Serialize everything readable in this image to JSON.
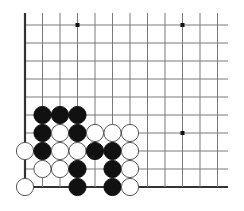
{
  "diagram": {
    "type": "go-board-corner",
    "corner": "bottom-left",
    "colors": {
      "line": "#7a7a7a",
      "edge": "#333333",
      "black": "#111111",
      "white": "#ffffff",
      "stone_outline": "#555555",
      "background": "#ffffff"
    },
    "grid": {
      "origin_x": 25,
      "origin_y": 25,
      "spacing_x": 17.5,
      "spacing_y": 18,
      "cols": 12,
      "rows": 10,
      "extend_right_to": 228,
      "extend_top_to": 13
    },
    "star_points": [
      {
        "col": 3,
        "row": 0
      },
      {
        "col": 9,
        "row": 0
      },
      {
        "col": 9,
        "row": 6
      }
    ],
    "stones": [
      {
        "color": "black",
        "col": 1,
        "row": 5
      },
      {
        "color": "black",
        "col": 2,
        "row": 5
      },
      {
        "color": "black",
        "col": 3,
        "row": 5
      },
      {
        "color": "black",
        "col": 1,
        "row": 6
      },
      {
        "color": "white",
        "col": 2,
        "row": 6
      },
      {
        "color": "black",
        "col": 3,
        "row": 6
      },
      {
        "color": "white",
        "col": 4,
        "row": 6
      },
      {
        "color": "white",
        "col": 5,
        "row": 6
      },
      {
        "color": "white",
        "col": 6,
        "row": 6
      },
      {
        "color": "white",
        "col": 0,
        "row": 7
      },
      {
        "color": "black",
        "col": 1,
        "row": 7
      },
      {
        "color": "white",
        "col": 2,
        "row": 7
      },
      {
        "color": "white",
        "col": 3,
        "row": 7
      },
      {
        "color": "black",
        "col": 4,
        "row": 7
      },
      {
        "color": "black",
        "col": 5,
        "row": 7
      },
      {
        "color": "white",
        "col": 6,
        "row": 7
      },
      {
        "color": "white",
        "col": 1,
        "row": 8
      },
      {
        "color": "white",
        "col": 2,
        "row": 8
      },
      {
        "color": "black",
        "col": 3,
        "row": 8
      },
      {
        "color": "black",
        "col": 5,
        "row": 8
      },
      {
        "color": "white",
        "col": 6,
        "row": 8
      },
      {
        "color": "white",
        "col": 0,
        "row": 9
      },
      {
        "color": "black",
        "col": 3,
        "row": 9
      },
      {
        "color": "black",
        "col": 5,
        "row": 9
      },
      {
        "color": "white",
        "col": 6,
        "row": 9
      }
    ]
  }
}
